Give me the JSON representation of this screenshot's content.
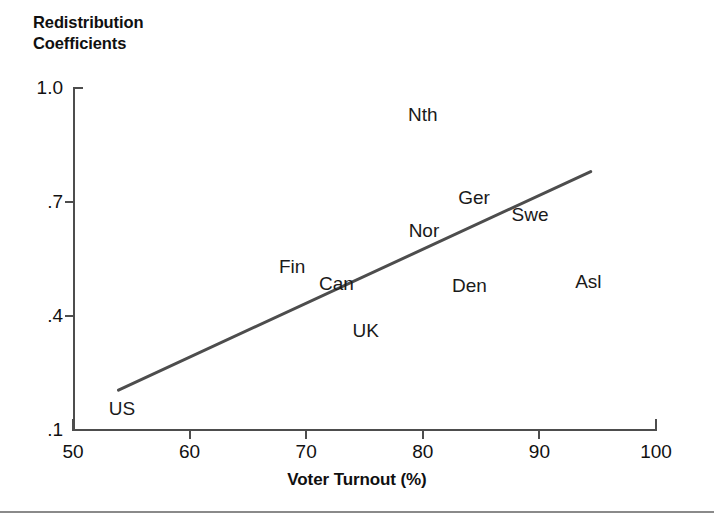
{
  "chart_data": {
    "type": "scatter",
    "title": "Redistribution\nCoefficients",
    "xlabel": "Voter Turnout (%)",
    "ylabel": "Redistribution Coefficients",
    "xlim": [
      50,
      100
    ],
    "ylim": [
      0.1,
      1.0
    ],
    "grid": false,
    "legend": "none",
    "point_label_style": "text-only (no markers)",
    "xticks": [
      "50",
      "60",
      "70",
      "80",
      "90",
      "100"
    ],
    "xtick_values": [
      50,
      60,
      70,
      80,
      90,
      100
    ],
    "yticks": [
      "1.0",
      ".7",
      ".4",
      ".1"
    ],
    "ytick_values": [
      1.0,
      0.7,
      0.4,
      0.1
    ],
    "points": [
      {
        "label": "Nth",
        "x": 80.0,
        "y": 0.93
      },
      {
        "label": "Ger",
        "x": 84.4,
        "y": 0.71
      },
      {
        "label": "Swe",
        "x": 89.2,
        "y": 0.666
      },
      {
        "label": "Nor",
        "x": 80.1,
        "y": 0.624
      },
      {
        "label": "Fin",
        "x": 68.8,
        "y": 0.53
      },
      {
        "label": "Can",
        "x": 72.6,
        "y": 0.485
      },
      {
        "label": "Den",
        "x": 84.0,
        "y": 0.48
      },
      {
        "label": "Asl",
        "x": 94.2,
        "y": 0.49
      },
      {
        "label": "UK",
        "x": 75.1,
        "y": 0.36
      },
      {
        "label": "US",
        "x": 54.2,
        "y": 0.155
      }
    ],
    "trend_line": {
      "type": "linear fit",
      "x_start": 53.9,
      "y_start": 0.205,
      "x_end": 94.4,
      "y_end": 0.78,
      "color": "#4d4d4d"
    }
  },
  "colors": {
    "axis": "#4d4d4d",
    "text": "#111111",
    "trend": "#4d4d4d",
    "background": "#ffffff",
    "rule": "#8a8a8a"
  }
}
